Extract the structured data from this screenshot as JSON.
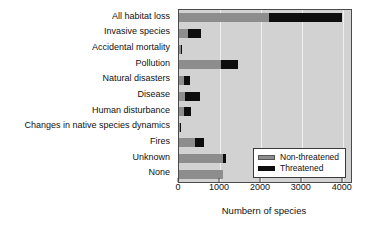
{
  "chart_data": {
    "type": "bar",
    "orientation": "horizontal",
    "stacked": true,
    "title": "",
    "xlabel": "Numbern of species",
    "ylabel": "",
    "xlim": [
      0,
      4200
    ],
    "xticks": [
      0,
      1000,
      2000,
      3000,
      4000
    ],
    "xticklabels": [
      "0",
      "1000",
      "2000",
      "3000",
      "4000"
    ],
    "grid": true,
    "grid_axis": "x",
    "legend_position": "lower right",
    "categories": [
      "All habitat loss",
      "Invasive species",
      "Accidental mortality",
      "Pollution",
      "Natural disasters",
      "Disease",
      "Human disturbance",
      "Changes in native species dynamics",
      "Fires",
      "Unknown",
      "None"
    ],
    "series": [
      {
        "name": "Non-threatened",
        "color": "#8d8d8d",
        "values": [
          2190,
          230,
          55,
          1020,
          120,
          140,
          130,
          25,
          400,
          1070,
          1070
        ]
      },
      {
        "name": "Threatened",
        "color": "#0d0d0d",
        "values": [
          1790,
          305,
          5,
          420,
          140,
          370,
          170,
          5,
          200,
          90,
          0
        ]
      }
    ],
    "totals": [
      3980,
      535,
      60,
      1440,
      260,
      510,
      300,
      30,
      600,
      1160,
      1070
    ]
  },
  "legend": {
    "items": [
      {
        "label": "Non-threatened",
        "swatch": "gray-swatch"
      },
      {
        "label": "Threatened",
        "swatch": "black-swatch"
      }
    ]
  },
  "colors": {
    "non_threatened": "#8d8d8d",
    "threatened": "#0d0d0d",
    "plot_background": "#d2d2d2",
    "gridline": "#efefef",
    "axis": "#4a4a4a",
    "page_background": "#ffffff"
  }
}
